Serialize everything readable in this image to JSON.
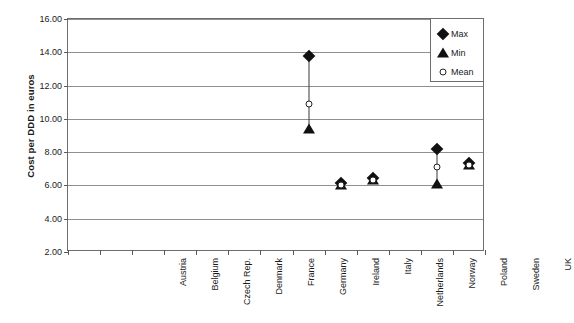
{
  "chart_data": {
    "type": "scatter",
    "title": "",
    "xlabel": "",
    "ylabel": "Cost per DDD in euros",
    "ylim": [
      2.0,
      16.0
    ],
    "ytick_step": 2.0,
    "ytick_labels": [
      "16.00",
      "14.00",
      "12.00",
      "10.00",
      "8.00",
      "6.00",
      "4.00",
      "2.00"
    ],
    "ytick_values": [
      16.0,
      14.0,
      12.0,
      10.0,
      8.0,
      6.0,
      4.0,
      2.0
    ],
    "grid": "horizontal",
    "legend_position": "top-right",
    "categories": [
      "Austria",
      "Belgium",
      "Czech Rep.",
      "Denmark",
      "France",
      "Germany",
      "Ireland",
      "Italy",
      "Netherlands",
      "Norway",
      "Poland",
      "Sweden",
      "UK"
    ],
    "series": [
      {
        "name": "Max",
        "marker": "filled-diamond",
        "color": "#111111",
        "values": [
          null,
          null,
          null,
          null,
          null,
          null,
          null,
          13.77,
          6.15,
          6.45,
          null,
          8.2,
          7.35
        ]
      },
      {
        "name": "Min",
        "marker": "filled-triangle",
        "color": "#111111",
        "values": [
          null,
          null,
          null,
          null,
          null,
          null,
          null,
          9.4,
          6.0,
          6.3,
          null,
          6.1,
          7.2
        ]
      },
      {
        "name": "Mean",
        "marker": "open-circle",
        "color": "#222222",
        "values": [
          null,
          null,
          null,
          null,
          null,
          null,
          null,
          10.9,
          6.05,
          6.35,
          null,
          7.1,
          7.25
        ]
      }
    ]
  },
  "legend": {
    "items": [
      {
        "label": "Max",
        "marker": "filled-diamond"
      },
      {
        "label": "Min",
        "marker": "filled-triangle"
      },
      {
        "label": "Mean",
        "marker": "open-circle"
      }
    ]
  },
  "caption": ""
}
